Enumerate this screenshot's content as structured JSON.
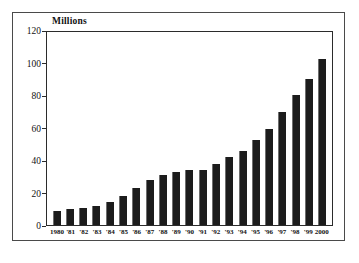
{
  "chart_data": {
    "type": "bar",
    "title": "",
    "subtitle": "",
    "units_label": "Millions",
    "xlabel": "",
    "ylabel": "",
    "ylim": [
      0,
      120
    ],
    "ytick_values": [
      0,
      20,
      40,
      60,
      80,
      100,
      120
    ],
    "ytick_labels": [
      "0",
      "20",
      "40",
      "60",
      "80",
      "100",
      "120"
    ],
    "grid": false,
    "legend": null,
    "bar_color": "#1c1c1c",
    "frame_color": "#4a4a4a",
    "axis_color": "#2b2b2b",
    "background": "#ffffff",
    "categories": [
      "1980",
      "'81",
      "'82",
      "'83",
      "'84",
      "'85",
      "'86",
      "'87",
      "'88",
      "'89",
      "'90",
      "'91",
      "'92",
      "'93",
      "'94",
      "'95",
      "'96",
      "'97",
      "'98",
      "'99",
      "2000"
    ],
    "values": [
      9,
      10,
      10.5,
      12,
      14.5,
      18,
      23,
      28,
      31,
      33,
      34,
      34,
      38,
      42,
      46,
      53,
      60,
      70.5,
      81,
      91,
      103
    ]
  }
}
